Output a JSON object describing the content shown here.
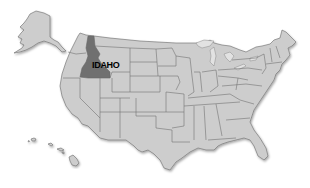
{
  "map": {
    "title": "United States",
    "highlighted_state": {
      "name": "Idaho",
      "label": "IDAHO",
      "color": "#6f6f6f"
    },
    "colors": {
      "state_fill": "#cdcdcd",
      "border": "#6a6a6a",
      "background": "#ffffff"
    },
    "insets": [
      "Alaska",
      "Hawaii"
    ]
  }
}
